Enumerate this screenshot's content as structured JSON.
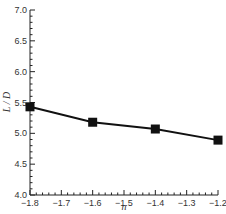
{
  "chart_data": {
    "type": "line",
    "title": "",
    "xlabel": "n",
    "ylabel": "L / D",
    "x": [
      -1.8,
      -1.6,
      -1.4,
      -1.2
    ],
    "series": [
      {
        "name": "L/D",
        "values": [
          5.43,
          5.18,
          5.07,
          4.89
        ],
        "marker": "square",
        "color": "#111111"
      }
    ],
    "xlim": [
      -1.8,
      -1.2
    ],
    "ylim": [
      4.0,
      7.0
    ],
    "xticks": [
      "-1.8",
      "-1.7",
      "-1.6",
      "-1.5",
      "-1.4",
      "-1.3",
      "-1.2"
    ],
    "yticks": [
      "4.0",
      "4.5",
      "5.0",
      "5.5",
      "6.0",
      "6.5",
      "7.0"
    ],
    "grid": false,
    "legend": null
  }
}
